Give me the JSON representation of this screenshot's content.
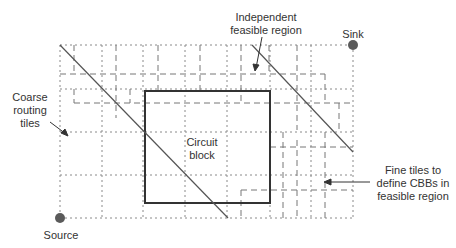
{
  "labels": {
    "independent_region": "Independent\nfeasible region",
    "sink": "Sink",
    "coarse_tiles": "Coarse\nrouting\ntiles",
    "circuit_block": "Circuit\nblock",
    "fine_tiles": "Fine tiles to\ndefine CBBs in\nfeasible region",
    "source": "Source"
  },
  "colors": {
    "line": "#555555",
    "grid": "#8a8a8a",
    "block": "#333333",
    "terminal": "#5a5a5a",
    "text": "#333333"
  }
}
